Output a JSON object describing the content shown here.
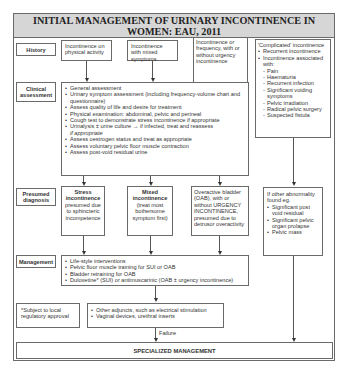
{
  "title": {
    "line1": "INITIAL MANAGEMENT OF URINARY INCONTINENCE IN",
    "line2": "WOMEN: EAU, 2011"
  },
  "rows": {
    "history": "History",
    "clinical": [
      "Clinical",
      "assessment"
    ],
    "diagnosis": [
      "Presumed",
      "diagnosis"
    ],
    "management": "Management"
  },
  "history": {
    "stress": "Incontinence on physical activity",
    "mixed": "Incontinence with mixed symptoms",
    "urgency": "Incontinence or frequency, with or without urgency incontinence",
    "complicated": {
      "heading": "'Complicated' incontinence",
      "items": [
        "Recurrent incontinence",
        "Incontinence associated with:"
      ],
      "subitems": [
        "Pain",
        "Haematuria",
        "Recurrent infection",
        "Significant voiding symptoms",
        "Pelvic irradiation",
        "Radical pelvic surgery",
        "Suspected fistula"
      ]
    }
  },
  "clinical_assessment": {
    "items": [
      "General assessment",
      "Urinary symptom assessment (including frequency-volume chart and questionnaire)",
      "Assess quality of life and desire for treatment",
      "Physical examination: abdominal, pelvic and perineal",
      "Cough test to demonstrate stress incontinence if appropriate",
      "Urinalysis ± urine culture → if infected, treat and reassess",
      "Assess oestrogen status and treat as appropriate",
      "Assess voluntary pelvic floor muscle contraction",
      "Assess post-void residual urine"
    ],
    "urinalysis_suffix": "if appropriate"
  },
  "diagnosis": {
    "stress": {
      "title": "Stress incontinence",
      "detail": "presumed due to sphincteric incompetence"
    },
    "mixed": {
      "title": "Mixed incontinence",
      "detail": "(treat most bothersome symptom first)"
    },
    "oab": "Overactive bladder (OAB), with or without URGENCY INCONTINENCE, presumed due to detrusor overactivity",
    "other": {
      "heading": "If other abnormality found eg.",
      "items": [
        "Significant post void residual",
        "Significant pelvic organ prolapse",
        "Pelvic mass"
      ]
    }
  },
  "management": {
    "items": [
      "Life-style interventions",
      "Pelvic floor muscle training for SUI or OAB",
      "Bladder retraining for OAB",
      "Duloxetine* (SUI) or antimuscarinic (OAB ± urgency incontinence)"
    ]
  },
  "footnote": "*Subject to local regulatory approval",
  "adjuncts": {
    "items": [
      "Other adjuncts, such as electrical stimulation",
      "Vaginal devices, urethral inserts"
    ]
  },
  "failure_label": "Failure",
  "specialized": "SPECIALIZED MANAGEMENT"
}
